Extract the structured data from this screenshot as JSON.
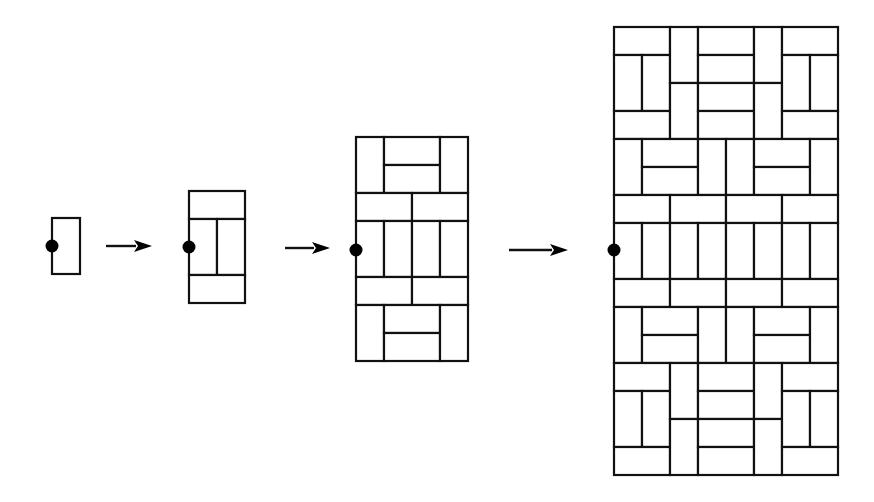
{
  "diagram": {
    "colors": {
      "line": "#111111",
      "background": "#ffffff",
      "dot": "#000000"
    },
    "stages": [
      {
        "id": "stage-1",
        "origin": [
          52,
          218
        ],
        "unit": 28,
        "cols": 1,
        "rows": 2,
        "dot": [
          52,
          246
        ],
        "dominoes": [
          {
            "c": 0,
            "r": 0,
            "w": 1,
            "h": 2
          }
        ]
      },
      {
        "id": "stage-2",
        "origin": [
          189,
          191
        ],
        "unit": 28,
        "cols": 2,
        "rows": 4,
        "dot": [
          189,
          247
        ],
        "dominoes": [
          {
            "c": 0,
            "r": 0,
            "w": 2,
            "h": 1
          },
          {
            "c": 0,
            "r": 1,
            "w": 1,
            "h": 2
          },
          {
            "c": 1,
            "r": 1,
            "w": 1,
            "h": 2
          },
          {
            "c": 0,
            "r": 3,
            "w": 2,
            "h": 1
          }
        ]
      },
      {
        "id": "stage-3",
        "origin": [
          356,
          137
        ],
        "unit": 28,
        "cols": 4,
        "rows": 8,
        "dot": [
          356,
          250
        ],
        "dominoes": [
          {
            "c": 0,
            "r": 0,
            "w": 1,
            "h": 2
          },
          {
            "c": 1,
            "r": 0,
            "w": 2,
            "h": 1
          },
          {
            "c": 1,
            "r": 1,
            "w": 2,
            "h": 1
          },
          {
            "c": 3,
            "r": 0,
            "w": 1,
            "h": 2
          },
          {
            "c": 0,
            "r": 2,
            "w": 2,
            "h": 1
          },
          {
            "c": 2,
            "r": 2,
            "w": 2,
            "h": 1
          },
          {
            "c": 0,
            "r": 3,
            "w": 1,
            "h": 2
          },
          {
            "c": 1,
            "r": 3,
            "w": 1,
            "h": 2
          },
          {
            "c": 2,
            "r": 3,
            "w": 1,
            "h": 2
          },
          {
            "c": 3,
            "r": 3,
            "w": 1,
            "h": 2
          },
          {
            "c": 0,
            "r": 5,
            "w": 2,
            "h": 1
          },
          {
            "c": 2,
            "r": 5,
            "w": 2,
            "h": 1
          },
          {
            "c": 0,
            "r": 6,
            "w": 1,
            "h": 2
          },
          {
            "c": 1,
            "r": 6,
            "w": 2,
            "h": 1
          },
          {
            "c": 1,
            "r": 7,
            "w": 2,
            "h": 1
          },
          {
            "c": 3,
            "r": 6,
            "w": 1,
            "h": 2
          }
        ]
      },
      {
        "id": "stage-4",
        "origin": [
          614,
          27
        ],
        "unit": 28,
        "cols": 8,
        "rows": 16,
        "dot": [
          614,
          250
        ],
        "dominoes": [
          {
            "c": 0,
            "r": 0,
            "w": 2,
            "h": 1
          },
          {
            "c": 0,
            "r": 1,
            "w": 1,
            "h": 2
          },
          {
            "c": 1,
            "r": 1,
            "w": 1,
            "h": 2
          },
          {
            "c": 0,
            "r": 3,
            "w": 2,
            "h": 1
          },
          {
            "c": 2,
            "r": 0,
            "w": 1,
            "h": 2
          },
          {
            "c": 2,
            "r": 2,
            "w": 1,
            "h": 2
          },
          {
            "c": 3,
            "r": 0,
            "w": 2,
            "h": 1
          },
          {
            "c": 3,
            "r": 1,
            "w": 2,
            "h": 1
          },
          {
            "c": 3,
            "r": 2,
            "w": 2,
            "h": 1
          },
          {
            "c": 3,
            "r": 3,
            "w": 2,
            "h": 1
          },
          {
            "c": 5,
            "r": 0,
            "w": 1,
            "h": 2
          },
          {
            "c": 5,
            "r": 2,
            "w": 1,
            "h": 2
          },
          {
            "c": 6,
            "r": 0,
            "w": 2,
            "h": 1
          },
          {
            "c": 6,
            "r": 1,
            "w": 1,
            "h": 2
          },
          {
            "c": 7,
            "r": 1,
            "w": 1,
            "h": 2
          },
          {
            "c": 6,
            "r": 3,
            "w": 2,
            "h": 1
          },
          {
            "c": 0,
            "r": 4,
            "w": 1,
            "h": 2
          },
          {
            "c": 1,
            "r": 4,
            "w": 2,
            "h": 1
          },
          {
            "c": 1,
            "r": 5,
            "w": 2,
            "h": 1
          },
          {
            "c": 3,
            "r": 4,
            "w": 1,
            "h": 2
          },
          {
            "c": 4,
            "r": 4,
            "w": 1,
            "h": 2
          },
          {
            "c": 5,
            "r": 4,
            "w": 2,
            "h": 1
          },
          {
            "c": 5,
            "r": 5,
            "w": 2,
            "h": 1
          },
          {
            "c": 7,
            "r": 4,
            "w": 1,
            "h": 2
          },
          {
            "c": 0,
            "r": 6,
            "w": 2,
            "h": 1
          },
          {
            "c": 2,
            "r": 6,
            "w": 2,
            "h": 1
          },
          {
            "c": 4,
            "r": 6,
            "w": 2,
            "h": 1
          },
          {
            "c": 6,
            "r": 6,
            "w": 2,
            "h": 1
          },
          {
            "c": 0,
            "r": 7,
            "w": 1,
            "h": 2
          },
          {
            "c": 1,
            "r": 7,
            "w": 1,
            "h": 2
          },
          {
            "c": 2,
            "r": 7,
            "w": 1,
            "h": 2
          },
          {
            "c": 3,
            "r": 7,
            "w": 1,
            "h": 2
          },
          {
            "c": 4,
            "r": 7,
            "w": 1,
            "h": 2
          },
          {
            "c": 5,
            "r": 7,
            "w": 1,
            "h": 2
          },
          {
            "c": 6,
            "r": 7,
            "w": 1,
            "h": 2
          },
          {
            "c": 7,
            "r": 7,
            "w": 1,
            "h": 2
          },
          {
            "c": 0,
            "r": 9,
            "w": 2,
            "h": 1
          },
          {
            "c": 2,
            "r": 9,
            "w": 2,
            "h": 1
          },
          {
            "c": 4,
            "r": 9,
            "w": 2,
            "h": 1
          },
          {
            "c": 6,
            "r": 9,
            "w": 2,
            "h": 1
          },
          {
            "c": 0,
            "r": 10,
            "w": 1,
            "h": 2
          },
          {
            "c": 1,
            "r": 10,
            "w": 2,
            "h": 1
          },
          {
            "c": 1,
            "r": 11,
            "w": 2,
            "h": 1
          },
          {
            "c": 3,
            "r": 10,
            "w": 1,
            "h": 2
          },
          {
            "c": 4,
            "r": 10,
            "w": 1,
            "h": 2
          },
          {
            "c": 5,
            "r": 10,
            "w": 2,
            "h": 1
          },
          {
            "c": 5,
            "r": 11,
            "w": 2,
            "h": 1
          },
          {
            "c": 7,
            "r": 10,
            "w": 1,
            "h": 2
          },
          {
            "c": 0,
            "r": 12,
            "w": 2,
            "h": 1
          },
          {
            "c": 0,
            "r": 13,
            "w": 1,
            "h": 2
          },
          {
            "c": 1,
            "r": 13,
            "w": 1,
            "h": 2
          },
          {
            "c": 0,
            "r": 15,
            "w": 2,
            "h": 1
          },
          {
            "c": 2,
            "r": 12,
            "w": 1,
            "h": 2
          },
          {
            "c": 2,
            "r": 14,
            "w": 1,
            "h": 2
          },
          {
            "c": 3,
            "r": 12,
            "w": 2,
            "h": 1
          },
          {
            "c": 3,
            "r": 13,
            "w": 2,
            "h": 1
          },
          {
            "c": 3,
            "r": 14,
            "w": 2,
            "h": 1
          },
          {
            "c": 3,
            "r": 15,
            "w": 2,
            "h": 1
          },
          {
            "c": 5,
            "r": 12,
            "w": 1,
            "h": 2
          },
          {
            "c": 5,
            "r": 14,
            "w": 1,
            "h": 2
          },
          {
            "c": 6,
            "r": 12,
            "w": 2,
            "h": 1
          },
          {
            "c": 6,
            "r": 13,
            "w": 1,
            "h": 2
          },
          {
            "c": 7,
            "r": 13,
            "w": 1,
            "h": 2
          },
          {
            "c": 6,
            "r": 15,
            "w": 2,
            "h": 1
          }
        ]
      }
    ],
    "arrows": [
      {
        "id": "arrow-1",
        "from": [
          106,
          246
        ],
        "to": [
          152,
          246
        ]
      },
      {
        "id": "arrow-2",
        "from": [
          285,
          248
        ],
        "to": [
          330,
          248
        ]
      },
      {
        "id": "arrow-3",
        "from": [
          509,
          250
        ],
        "to": [
          568,
          250
        ]
      }
    ]
  }
}
